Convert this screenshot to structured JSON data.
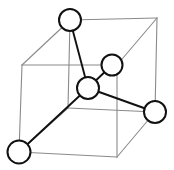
{
  "figure": {
    "kind": "diagram",
    "background_color": "#ffffff",
    "width": 174,
    "height": 170,
    "cube": {
      "label": "cubic unit cell wireframe",
      "edge_color": "#8a8a8a",
      "edge_width": 1.1,
      "vertices": {
        "front_top_left": [
          22,
          65
        ],
        "front_top_right": [
          117,
          65
        ],
        "front_bottom_left": [
          19,
          152
        ],
        "front_bottom_right": [
          117,
          157
        ],
        "back_top_left": [
          70,
          20
        ],
        "back_top_right": [
          157,
          18
        ],
        "back_bottom_left": [
          68,
          108
        ],
        "back_bottom_right": [
          155,
          112
        ]
      },
      "edges": [
        [
          "front_top_left",
          "front_top_right"
        ],
        [
          "front_top_right",
          "front_bottom_right"
        ],
        [
          "front_bottom_right",
          "front_bottom_left"
        ],
        [
          "front_bottom_left",
          "front_top_left"
        ],
        [
          "back_top_left",
          "back_top_right"
        ],
        [
          "back_top_right",
          "back_bottom_right"
        ],
        [
          "back_bottom_right",
          "back_bottom_left"
        ],
        [
          "back_bottom_left",
          "back_top_left"
        ],
        [
          "front_top_left",
          "back_top_left"
        ],
        [
          "front_top_right",
          "back_top_right"
        ],
        [
          "front_bottom_left",
          "back_bottom_left"
        ],
        [
          "front_bottom_right",
          "back_bottom_right"
        ]
      ]
    },
    "atoms": [
      {
        "id": "atom-top",
        "cx": 70,
        "cy": 20,
        "r": 11,
        "position": "back top left corner"
      },
      {
        "id": "atom-upper-right",
        "cx": 112,
        "cy": 65,
        "r": 10.5,
        "position": "upper right interior"
      },
      {
        "id": "atom-center",
        "cx": 88,
        "cy": 88,
        "r": 11,
        "position": "body center"
      },
      {
        "id": "atom-right",
        "cx": 155,
        "cy": 112,
        "r": 11,
        "position": "back bottom right corner"
      },
      {
        "id": "atom-bottom-left",
        "cx": 19,
        "cy": 152,
        "r": 11.5,
        "position": "front bottom left corner"
      }
    ],
    "bonds": [
      {
        "from": "atom-center",
        "to": "atom-top",
        "label": "bond center to top"
      },
      {
        "from": "atom-center",
        "to": "atom-upper-right",
        "label": "bond center to upper right"
      },
      {
        "from": "atom-center",
        "to": "atom-right",
        "label": "bond center to right"
      },
      {
        "from": "atom-center",
        "to": "atom-bottom-left",
        "label": "bond center to bottom left"
      }
    ],
    "bond_color": "#111111",
    "bond_width": 1.9,
    "atom_fill": "#ffffff",
    "atom_stroke": "#111111",
    "atom_stroke_width": 2.0
  }
}
